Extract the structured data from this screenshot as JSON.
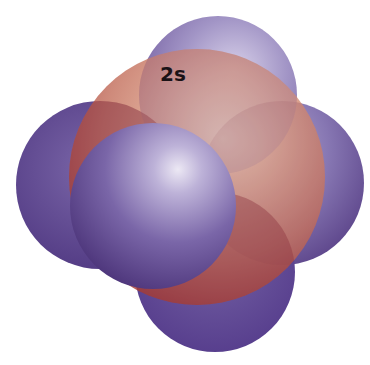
{
  "diagram": {
    "labels": {
      "orbital": "2s"
    },
    "colors": {
      "background": "#ffffff",
      "lobe_purple": "#5b4288",
      "lobe_purple_light": "#a99ccc",
      "orbital_orange_light": "#f0b890",
      "orbital_orange_mid": "#d08878",
      "orbital_red_dark": "#a8403c",
      "front_sphere_highlight": "#e8e4f2",
      "front_sphere_shadow": "#4a3478",
      "label_text": "#1a1216"
    },
    "shapes": [
      {
        "name": "top-lobe",
        "cx": 218,
        "cy": 95,
        "r": 79
      },
      {
        "name": "left-lobe",
        "cx": 100,
        "cy": 185,
        "r": 84
      },
      {
        "name": "right-lobe",
        "cx": 282,
        "cy": 183,
        "r": 82
      },
      {
        "name": "bottom-lobe",
        "cx": 215,
        "cy": 272,
        "r": 80
      },
      {
        "name": "2s-sphere",
        "cx": 197,
        "cy": 177,
        "r": 128
      },
      {
        "name": "front-lobe",
        "cx": 153,
        "cy": 206,
        "r": 83
      }
    ]
  }
}
